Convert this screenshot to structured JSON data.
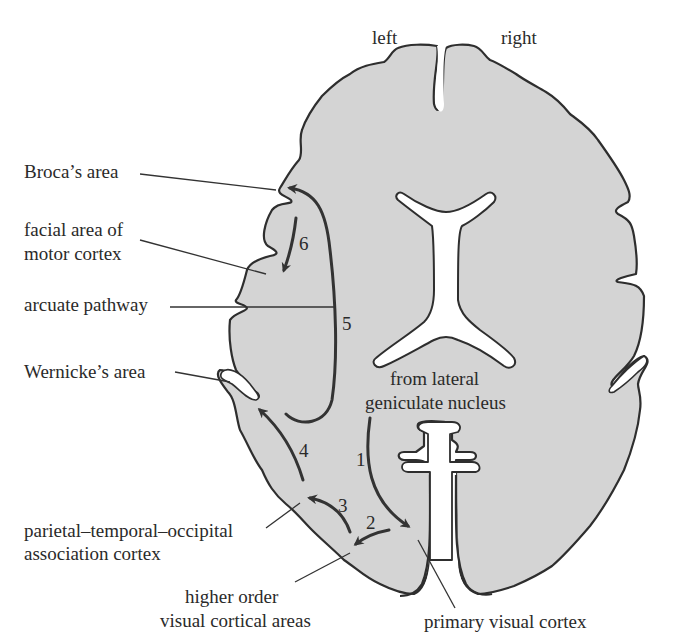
{
  "figure": {
    "type": "horizontal section of the brain (viewed from above) showing language pathways",
    "fill_color": "#d4d4d4",
    "stroke_color": "#2e2e2e",
    "background_color": "#ffffff"
  },
  "orientation": {
    "left": "left",
    "right": "right"
  },
  "labels": {
    "broca": "Broca’s area",
    "facial_line1": "facial area of",
    "facial_line2": "motor cortex",
    "arcuate": "arcuate pathway",
    "wernicke": "Wernicke’s area",
    "lgn_line1": "from lateral",
    "lgn_line2": "geniculate nucleus",
    "ptoa_line1": "parietal–temporal–occipital",
    "ptoa_line2": "association  cortex",
    "higher_line1": "higher order",
    "higher_line2": "visual cortical areas",
    "primary_visual": "primary visual cortex"
  },
  "pathway_steps": [
    {
      "number": "1",
      "from": "lateral geniculate nucleus",
      "to": "primary visual cortex"
    },
    {
      "number": "2",
      "from": "primary visual cortex",
      "to": "higher order visual cortical areas"
    },
    {
      "number": "3",
      "from": "higher order visual cortical areas",
      "to": "parietal–temporal–occipital association cortex"
    },
    {
      "number": "4",
      "from": "parietal–temporal–occipital association cortex",
      "to": "Wernicke’s area"
    },
    {
      "number": "5",
      "from": "Wernicke’s area",
      "to": "Broca’s area",
      "via": "arcuate pathway"
    },
    {
      "number": "6",
      "from": "Broca’s area",
      "to": "facial area of motor cortex"
    }
  ]
}
